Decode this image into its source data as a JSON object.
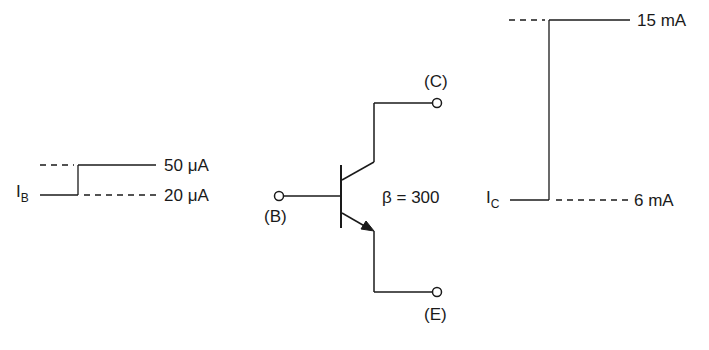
{
  "base_current": {
    "symbol": "I",
    "subscript": "B",
    "high_value": "50 μA",
    "low_value": "20 μA"
  },
  "collector_current": {
    "symbol": "I",
    "subscript": "C",
    "high_value": "15 mA",
    "low_value": "6 mA"
  },
  "transistor": {
    "collector_label": "(C)",
    "base_label": "(B)",
    "emitter_label": "(E)",
    "beta_label": "β = 300"
  },
  "colors": {
    "line": "#1a1a1a",
    "dashed": "#333333",
    "background": "#ffffff"
  }
}
